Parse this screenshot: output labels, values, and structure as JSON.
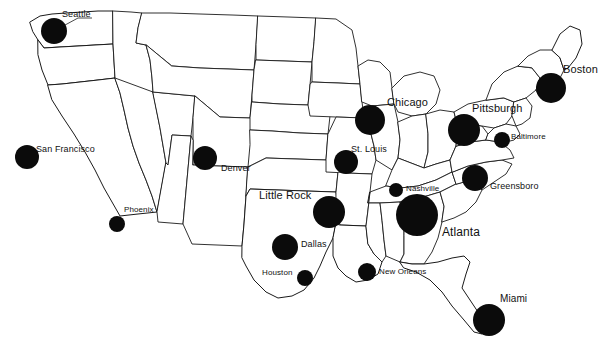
{
  "chart_data": {
    "type": "scatter",
    "title": "",
    "subtitle": "",
    "xlabel": "",
    "ylabel": "",
    "map_region": "United States (contiguous 48 states)",
    "symbol_type": "proportional-circle",
    "symbol_color": "#0b0b0b",
    "background_color": "#ffffff",
    "border_color": "#1a1a1a",
    "legend": "none",
    "grid": false,
    "categories": [
      "Seattle",
      "San Francisco",
      "Phoenix",
      "Denver",
      "Dallas",
      "Houston",
      "Little Rock",
      "New Orleans",
      "St. Louis",
      "Chicago",
      "Nashville",
      "Atlanta",
      "Miami",
      "Greensboro",
      "Baltimore",
      "Pittsburgh",
      "Boston"
    ],
    "values": [
      13,
      12,
      8,
      12,
      13,
      8,
      16,
      9,
      12,
      15,
      7,
      21,
      16,
      13,
      8,
      16,
      15
    ],
    "series": [
      {
        "name": "Circle radius (px)",
        "values": [
          13,
          12,
          8,
          12,
          13,
          8,
          16,
          9,
          12,
          15,
          7,
          21,
          16,
          13,
          8,
          16,
          15
        ]
      }
    ]
  },
  "map": {
    "cities": [
      {
        "name": "Seattle",
        "cx": 54,
        "cy": 31,
        "r": 13,
        "label_x": 62,
        "label_y": 10,
        "font_size": 9,
        "leader": "M 54 31 L 78 18 L 92 18"
      },
      {
        "name": "San Francisco",
        "cx": 27,
        "cy": 157,
        "r": 12,
        "label_x": 36,
        "label_y": 145,
        "font_size": 9,
        "leader": ""
      },
      {
        "name": "Phoenix",
        "cx": 117,
        "cy": 224,
        "r": 8,
        "label_x": 124,
        "label_y": 206,
        "font_size": 8,
        "leader": ""
      },
      {
        "name": "Denver",
        "cx": 205,
        "cy": 158,
        "r": 12,
        "label_x": 221,
        "label_y": 164,
        "font_size": 9,
        "leader": ""
      },
      {
        "name": "Dallas",
        "cx": 285,
        "cy": 247,
        "r": 13,
        "label_x": 301,
        "label_y": 240,
        "font_size": 9,
        "leader": ""
      },
      {
        "name": "Houston",
        "cx": 305,
        "cy": 278,
        "r": 8,
        "label_x": 262,
        "label_y": 269,
        "font_size": 8,
        "leader": ""
      },
      {
        "name": "Little Rock",
        "cx": 329,
        "cy": 212,
        "r": 16,
        "label_x": 259,
        "label_y": 190,
        "font_size": 11,
        "leader": ""
      },
      {
        "name": "New Orleans",
        "cx": 367,
        "cy": 272,
        "r": 9,
        "label_x": 379,
        "label_y": 268,
        "font_size": 8,
        "leader": ""
      },
      {
        "name": "St. Louis",
        "cx": 346,
        "cy": 162,
        "r": 12,
        "label_x": 351,
        "label_y": 145,
        "font_size": 9,
        "leader": ""
      },
      {
        "name": "Chicago",
        "cx": 370,
        "cy": 120,
        "r": 15,
        "label_x": 387,
        "label_y": 97,
        "font_size": 11,
        "leader": ""
      },
      {
        "name": "Nashville",
        "cx": 396,
        "cy": 190,
        "r": 7,
        "label_x": 406,
        "label_y": 185,
        "font_size": 8,
        "leader": ""
      },
      {
        "name": "Atlanta",
        "cx": 417,
        "cy": 215,
        "r": 21,
        "label_x": 442,
        "label_y": 226,
        "font_size": 12,
        "leader": ""
      },
      {
        "name": "Miami",
        "cx": 489,
        "cy": 320,
        "r": 16,
        "label_x": 500,
        "label_y": 294,
        "font_size": 10,
        "leader": ""
      },
      {
        "name": "Greensboro",
        "cx": 475,
        "cy": 178,
        "r": 13,
        "label_x": 490,
        "label_y": 182,
        "font_size": 9,
        "leader": ""
      },
      {
        "name": "Baltimore",
        "cx": 502,
        "cy": 140,
        "r": 8,
        "label_x": 511,
        "label_y": 133,
        "font_size": 8,
        "leader": ""
      },
      {
        "name": "Pittsburgh",
        "cx": 464,
        "cy": 130,
        "r": 16,
        "label_x": 472,
        "label_y": 103,
        "font_size": 11,
        "leader": ""
      },
      {
        "name": "Boston",
        "cx": 551,
        "cy": 88,
        "r": 15,
        "label_x": 563,
        "label_y": 64,
        "font_size": 11,
        "leader": ""
      }
    ]
  }
}
